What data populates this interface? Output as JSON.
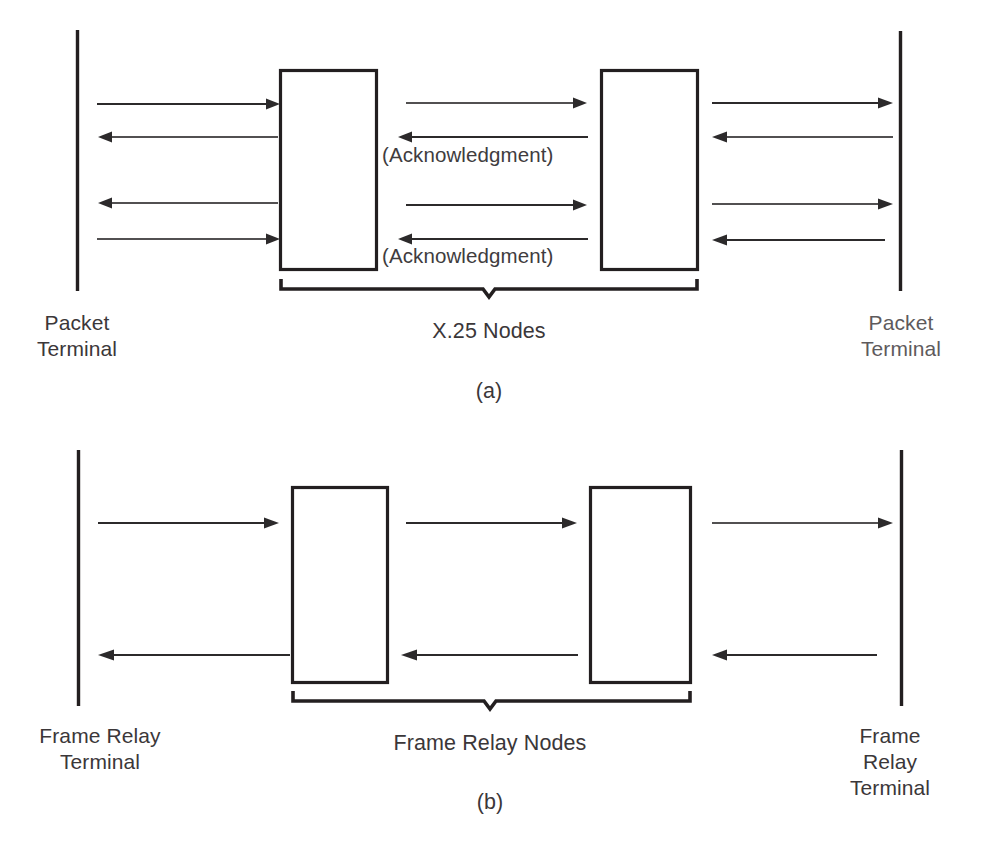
{
  "figure": {
    "caption_a": "(a)",
    "caption_b": "(b)",
    "panels": [
      {
        "id": "a",
        "caption": "(a)",
        "left_terminal_label": "Packet\nTerminal",
        "right_terminal_label": "Packet\nTerminal",
        "nodes_label": "X.25 Nodes",
        "node_count": 2,
        "annotations": [
          {
            "text": "(Acknowledgment)",
            "for_arrow": "middle-reverse-upper"
          },
          {
            "text": "(Acknowledgment)",
            "for_arrow": "middle-reverse-lower"
          }
        ],
        "segments": [
          {
            "name": "left-link",
            "arrows": [
              {
                "direction": "right",
                "y": 104
              },
              {
                "direction": "left",
                "y": 137
              },
              {
                "direction": "left",
                "y": 203
              },
              {
                "direction": "right",
                "y": 239
              }
            ]
          },
          {
            "name": "middle-link",
            "arrows": [
              {
                "direction": "right",
                "y": 103
              },
              {
                "direction": "left",
                "y": 137
              },
              {
                "direction": "right",
                "y": 205
              },
              {
                "direction": "left",
                "y": 239
              }
            ]
          },
          {
            "name": "right-link",
            "arrows": [
              {
                "direction": "right",
                "y": 103
              },
              {
                "direction": "left",
                "y": 137
              },
              {
                "direction": "right",
                "y": 204
              },
              {
                "direction": "left",
                "y": 240
              }
            ]
          }
        ]
      },
      {
        "id": "b",
        "caption": "(b)",
        "left_terminal_label": "Frame Relay\nTerminal",
        "right_terminal_label": "Frame Relay\nTerminal",
        "nodes_label": "Frame Relay Nodes",
        "node_count": 2,
        "annotations": [],
        "segments": [
          {
            "name": "left-link",
            "arrows": [
              {
                "direction": "right",
                "y": 523
              },
              {
                "direction": "left",
                "y": 655
              }
            ]
          },
          {
            "name": "middle-link",
            "arrows": [
              {
                "direction": "right",
                "y": 523
              },
              {
                "direction": "left",
                "y": 655
              }
            ]
          },
          {
            "name": "right-link",
            "arrows": [
              {
                "direction": "right",
                "y": 523
              },
              {
                "direction": "left",
                "y": 655
              }
            ]
          }
        ]
      }
    ]
  },
  "colors": {
    "ink": "#231f20",
    "line": "#2c2a2b",
    "text": "#3b3739",
    "background": "#ffffff"
  }
}
